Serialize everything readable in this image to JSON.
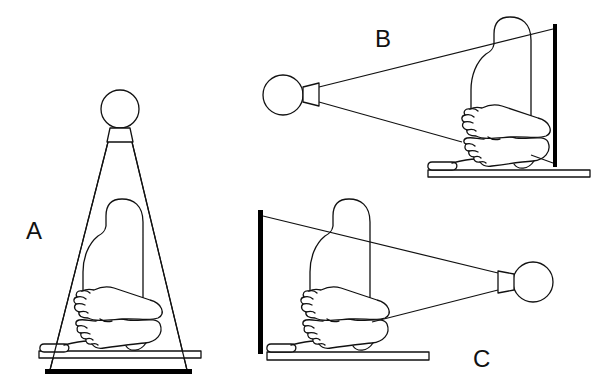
{
  "figure": {
    "colors": {
      "line": "#111111",
      "detector": "#000000",
      "background": "#ffffff"
    },
    "panels": [
      {
        "label": "A",
        "view": "top source, detector below table",
        "source": {
          "cx": 120,
          "cy": 109,
          "r": 19
        },
        "detector": {
          "x": 45,
          "y": 369,
          "w": 147,
          "h": 5,
          "orientation": "horizontal"
        },
        "table": {
          "x": 39,
          "y": 351,
          "w": 162,
          "h": 7
        }
      },
      {
        "label": "B",
        "view": "left source, detector on right",
        "source": {
          "cx": 283,
          "cy": 95,
          "r": 20
        },
        "detector": {
          "x": 553,
          "y": 24,
          "w": 4,
          "h": 143,
          "orientation": "vertical"
        },
        "table": {
          "x": 428,
          "y": 170,
          "w": 162,
          "h": 7
        }
      },
      {
        "label": "C",
        "view": "right source, detector on left",
        "source": {
          "cx": 533,
          "cy": 282,
          "r": 20
        },
        "detector": {
          "x": 258,
          "y": 210,
          "w": 5,
          "h": 144,
          "orientation": "vertical"
        },
        "table": {
          "x": 267,
          "y": 352,
          "w": 162,
          "h": 8
        }
      }
    ]
  },
  "labels": {
    "a": "A",
    "b": "B",
    "c": "C"
  }
}
